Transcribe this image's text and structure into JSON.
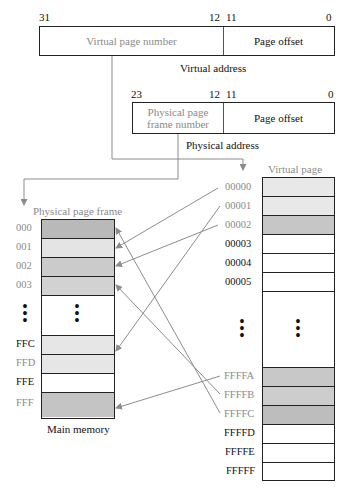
{
  "virtual_address": {
    "caption": "Virtual address",
    "bits": {
      "high": "31",
      "split_hi": "12",
      "split_lo": "11",
      "low": "0"
    },
    "fields": {
      "page_number": "Virtual page number",
      "offset": "Page offset"
    }
  },
  "physical_address": {
    "caption": "Physical address",
    "bits": {
      "high": "23",
      "split_hi": "12",
      "split_lo": "11",
      "low": "0"
    },
    "fields": {
      "frame_number_line1": "Physical page",
      "frame_number_line2": "frame number",
      "offset": "Page offset"
    }
  },
  "main_memory": {
    "title": "Physical page frame",
    "caption": "Main memory",
    "rows_top": [
      {
        "label": "000",
        "fill": "#b9b9b9",
        "label_color": "#8a8a8a"
      },
      {
        "label": "001",
        "fill": "#e4e4e4",
        "label_color": "#8a8a8a"
      },
      {
        "label": "002",
        "fill": "#cbcbcb",
        "label_color": "#8a8a8a"
      },
      {
        "label": "003",
        "fill": "#d2d2d2",
        "label_color": "#8a8a8a"
      }
    ],
    "ellipsis": "⋮",
    "rows_bottom": [
      {
        "label": "FFC",
        "fill": "#e6e6e6",
        "label_color": "#111111"
      },
      {
        "label": "FFD",
        "fill": "#e6e6e6",
        "label_color": "#8a8a8a"
      },
      {
        "label": "FFE",
        "fill": "#ffffff",
        "label_color": "#111111"
      },
      {
        "label": "FFF",
        "fill": "#c4c4c4",
        "label_color": "#8a8a8a"
      }
    ]
  },
  "virtual_pages": {
    "title": "Virtual page",
    "rows_top": [
      {
        "label": "00000",
        "fill": "#e8e8e8",
        "label_color": "#8a8a8a"
      },
      {
        "label": "00001",
        "fill": "#e8e8e8",
        "label_color": "#8a8a8a"
      },
      {
        "label": "00002",
        "fill": "#c6c6c6",
        "label_color": "#8a8a8a"
      },
      {
        "label": "00003",
        "fill": "#ffffff",
        "label_color": "#111111"
      },
      {
        "label": "00004",
        "fill": "#ffffff",
        "label_color": "#111111"
      },
      {
        "label": "00005",
        "fill": "#ffffff",
        "label_color": "#111111"
      }
    ],
    "ellipsis": "⋮",
    "rows_bottom": [
      {
        "label": "FFFFA",
        "fill": "#c8c8c8",
        "label_color": "#8a8a8a"
      },
      {
        "label": "FFFFB",
        "fill": "#cdcdcd",
        "label_color": "#8a8a8a"
      },
      {
        "label": "FFFFC",
        "fill": "#bdbdbd",
        "label_color": "#8a8a8a"
      },
      {
        "label": "FFFFD",
        "fill": "#ffffff",
        "label_color": "#111111"
      },
      {
        "label": "FFFFE",
        "fill": "#ffffff",
        "label_color": "#111111"
      },
      {
        "label": "FFFFF",
        "fill": "#ffffff",
        "label_color": "#111111"
      }
    ]
  },
  "mappings": [
    {
      "virtual": "00000",
      "physical": "001"
    },
    {
      "virtual": "00001",
      "physical": "FFD"
    },
    {
      "virtual": "00002",
      "physical": "002"
    },
    {
      "virtual": "FFFFA",
      "physical": "FFF"
    },
    {
      "virtual": "FFFFB",
      "physical": "003"
    },
    {
      "virtual": "FFFFC",
      "physical": "000"
    }
  ],
  "colors": {
    "line": "#8c8c8c",
    "border": "#222222",
    "muted_text": "#8a8a8a"
  }
}
